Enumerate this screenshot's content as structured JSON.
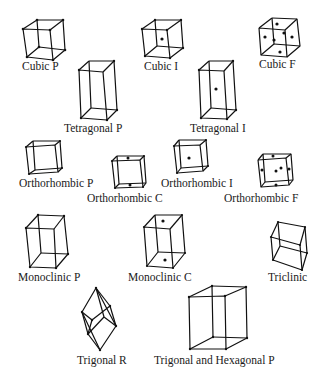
{
  "figure": {
    "lattices": [
      {
        "id": "cubic-p",
        "label": "Cubic P",
        "system": "Cubic",
        "centering": "P"
      },
      {
        "id": "cubic-i",
        "label": "Cubic I",
        "system": "Cubic",
        "centering": "I"
      },
      {
        "id": "cubic-f",
        "label": "Cubic F",
        "system": "Cubic",
        "centering": "F"
      },
      {
        "id": "tetragonal-p",
        "label": "Tetragonal P",
        "system": "Tetragonal",
        "centering": "P"
      },
      {
        "id": "tetragonal-i",
        "label": "Tetragonal I",
        "system": "Tetragonal",
        "centering": "I"
      },
      {
        "id": "orthorhombic-p",
        "label": "Orthorhombic P",
        "system": "Orthorhombic",
        "centering": "P"
      },
      {
        "id": "orthorhombic-c",
        "label": "Orthorhombic C",
        "system": "Orthorhombic",
        "centering": "C"
      },
      {
        "id": "orthorhombic-i",
        "label": "Orthorhombic I",
        "system": "Orthorhombic",
        "centering": "I"
      },
      {
        "id": "orthorhombic-f",
        "label": "Orthorhombic F",
        "system": "Orthorhombic",
        "centering": "F"
      },
      {
        "id": "monoclinic-p",
        "label": "Monoclinic P",
        "system": "Monoclinic",
        "centering": "P"
      },
      {
        "id": "monoclinic-c",
        "label": "Monoclinic C",
        "system": "Monoclinic",
        "centering": "C"
      },
      {
        "id": "triclinic",
        "label": "Triclinic",
        "system": "Triclinic",
        "centering": "P"
      },
      {
        "id": "trigonal-r",
        "label": "Trigonal R",
        "system": "Trigonal",
        "centering": "R"
      },
      {
        "id": "trigonal-hexagonal-p",
        "label": "Trigonal and Hexagonal P",
        "system": "Trigonal/Hexagonal",
        "centering": "P"
      }
    ]
  },
  "colors": {
    "background": "#ffffff",
    "line": "#111111",
    "text": "#1a1a1a"
  }
}
